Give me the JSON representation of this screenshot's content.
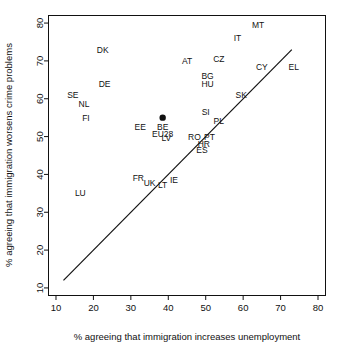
{
  "chart_data": {
    "type": "scatter",
    "title": "",
    "xlabel": "% agreeing that immigration increases unemployment",
    "ylabel": "% agreeing that immigration worsens crime problems",
    "xlim": [
      8,
      82
    ],
    "ylim": [
      8,
      82
    ],
    "xticks": [
      10,
      20,
      30,
      40,
      50,
      60,
      70,
      80
    ],
    "yticks": [
      10,
      20,
      30,
      40,
      50,
      60,
      70,
      80
    ],
    "grid": false,
    "legend": "none",
    "annotations": [
      {
        "label": "EU28",
        "x": 38.5,
        "y": 55.0,
        "marker": true,
        "label_dx": 0,
        "label_dy": -4.2
      },
      {
        "label": "MT",
        "x": 64.0,
        "y": 79.5,
        "marker": false,
        "label_dx": 0,
        "label_dy": 0
      },
      {
        "label": "IT",
        "x": 58.5,
        "y": 76.0,
        "marker": false,
        "label_dx": 0,
        "label_dy": 0
      },
      {
        "label": "DK",
        "x": 22.5,
        "y": 73.0,
        "marker": false,
        "label_dx": 0,
        "label_dy": 0
      },
      {
        "label": "CZ",
        "x": 53.5,
        "y": 70.5,
        "marker": false,
        "label_dx": 0,
        "label_dy": 0
      },
      {
        "label": "AT",
        "x": 45.0,
        "y": 70.0,
        "marker": false,
        "label_dx": 0,
        "label_dy": 0
      },
      {
        "label": "CY",
        "x": 65.0,
        "y": 68.5,
        "marker": false,
        "label_dx": 0,
        "label_dy": 0
      },
      {
        "label": "EL",
        "x": 73.5,
        "y": 68.5,
        "marker": false,
        "label_dx": 0,
        "label_dy": 0
      },
      {
        "label": "BG",
        "x": 50.5,
        "y": 66.0,
        "marker": false,
        "label_dx": 0,
        "label_dy": 0
      },
      {
        "label": "HU",
        "x": 50.5,
        "y": 64.0,
        "marker": false,
        "label_dx": 0,
        "label_dy": 0
      },
      {
        "label": "DE",
        "x": 23.0,
        "y": 64.0,
        "marker": false,
        "label_dx": 0,
        "label_dy": 0
      },
      {
        "label": "SE",
        "x": 14.5,
        "y": 61.0,
        "marker": false,
        "label_dx": 0,
        "label_dy": 0
      },
      {
        "label": "SK",
        "x": 59.5,
        "y": 61.0,
        "marker": false,
        "label_dx": 0,
        "label_dy": 0
      },
      {
        "label": "NL",
        "x": 17.5,
        "y": 58.5,
        "marker": false,
        "label_dx": 0,
        "label_dy": 0
      },
      {
        "label": "SI",
        "x": 50.0,
        "y": 56.5,
        "marker": false,
        "label_dx": 0,
        "label_dy": 0
      },
      {
        "label": "FI",
        "x": 18.0,
        "y": 55.0,
        "marker": false,
        "label_dx": 0,
        "label_dy": 0
      },
      {
        "label": "PL",
        "x": 53.5,
        "y": 54.0,
        "marker": false,
        "label_dx": 0,
        "label_dy": 0
      },
      {
        "label": "BE",
        "x": 38.5,
        "y": 52.5,
        "marker": false,
        "label_dx": 0,
        "label_dy": 0
      },
      {
        "label": "EE",
        "x": 32.5,
        "y": 52.5,
        "marker": false,
        "label_dx": 0,
        "label_dy": 0
      },
      {
        "label": "RO",
        "x": 47.0,
        "y": 50.0,
        "marker": false,
        "label_dx": 0,
        "label_dy": 0
      },
      {
        "label": "PT",
        "x": 51.0,
        "y": 50.0,
        "marker": false,
        "label_dx": 0,
        "label_dy": 0
      },
      {
        "label": "LV",
        "x": 39.5,
        "y": 49.5,
        "marker": false,
        "label_dx": 0,
        "label_dy": 0
      },
      {
        "label": "HR",
        "x": 49.5,
        "y": 48.0,
        "marker": false,
        "label_dx": 0,
        "label_dy": 0
      },
      {
        "label": "ES",
        "x": 49.0,
        "y": 46.5,
        "marker": false,
        "label_dx": 0,
        "label_dy": 0
      },
      {
        "label": "FR",
        "x": 32.0,
        "y": 39.0,
        "marker": false,
        "label_dx": 0,
        "label_dy": 0
      },
      {
        "label": "IE",
        "x": 41.5,
        "y": 38.5,
        "marker": false,
        "label_dx": 0,
        "label_dy": 0
      },
      {
        "label": "UK",
        "x": 35.0,
        "y": 37.8,
        "marker": false,
        "label_dx": 0,
        "label_dy": 0
      },
      {
        "label": "LT",
        "x": 38.5,
        "y": 37.3,
        "marker": false,
        "label_dx": 0,
        "label_dy": 0
      },
      {
        "label": "LU",
        "x": 16.5,
        "y": 35.0,
        "marker": false,
        "label_dx": 0,
        "label_dy": 0
      }
    ],
    "trend_line": {
      "x1": 12.0,
      "y1": 12.0,
      "x2": 73.0,
      "y2": 73.0
    }
  },
  "colors": {
    "axis": "#111111",
    "marker": "#111111",
    "background": "#ffffff"
  }
}
